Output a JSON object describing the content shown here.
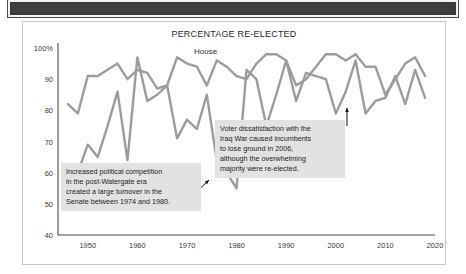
{
  "header": {
    "band_color": "#3f3f3f"
  },
  "figure": {
    "title": "PERCENTAGE RE-ELECTED",
    "border_color": "#c9c9c9",
    "background": "#ffffff"
  },
  "series_labels": {
    "house": "House",
    "senate": "Senate"
  },
  "annotations": [
    {
      "name": "watergate-annotation",
      "lines": [
        "Increased political competition",
        "in the post-Watergate era",
        "created a large turnover in the",
        "Senate between 1974 and 1980."
      ]
    },
    {
      "name": "iraq-war-annotation",
      "lines": [
        "Voter dissatisfaction with the",
        "Iraq War caused incumbents",
        "to lose ground in 2006,",
        "although the overwhelming",
        "majority were re-elected."
      ]
    }
  ],
  "chart_data": {
    "type": "line",
    "title": "PERCENTAGE RE-ELECTED",
    "xlabel": "",
    "ylabel": "",
    "xlim": [
      1944,
      2020
    ],
    "ylim": [
      40,
      100
    ],
    "xticks": [
      1950,
      1960,
      1970,
      1980,
      1990,
      2000,
      2010,
      2020
    ],
    "xticklabels": [
      "1950",
      "1960",
      "1970",
      "1980",
      "1990",
      "2000",
      "2010",
      "2020"
    ],
    "yticks": [
      40,
      50,
      60,
      70,
      80,
      90,
      100
    ],
    "yticklabels": [
      "40",
      "50",
      "60",
      "70",
      "80",
      "90",
      "100%"
    ],
    "grid": false,
    "legend": "inline-labels",
    "line_color": "#9c9c9c",
    "x": [
      1946,
      1948,
      1950,
      1952,
      1954,
      1956,
      1958,
      1960,
      1962,
      1964,
      1966,
      1968,
      1970,
      1972,
      1974,
      1976,
      1978,
      1980,
      1982,
      1984,
      1986,
      1988,
      1990,
      1992,
      1994,
      1996,
      1998,
      2000,
      2002,
      2004,
      2006,
      2008,
      2010,
      2012,
      2014,
      2016,
      2018
    ],
    "series": [
      {
        "name": "House",
        "values": [
          82,
          79,
          91,
          91,
          93,
          95,
          90,
          93,
          92,
          87,
          88,
          97,
          95,
          94,
          88,
          96,
          94,
          91,
          90,
          95,
          98,
          98,
          96,
          88,
          90,
          94,
          98,
          98,
          96,
          98,
          94,
          94,
          85,
          90,
          95,
          97,
          91
        ]
      },
      {
        "name": "Senate",
        "values": [
          57,
          60,
          69,
          65,
          75,
          86,
          64,
          97,
          83,
          85,
          88,
          71,
          77,
          74,
          85,
          64,
          60,
          55,
          93,
          90,
          75,
          85,
          96,
          83,
          92,
          91,
          90,
          79,
          86,
          96,
          79,
          83,
          84,
          91,
          82,
          93,
          84
        ]
      }
    ]
  }
}
